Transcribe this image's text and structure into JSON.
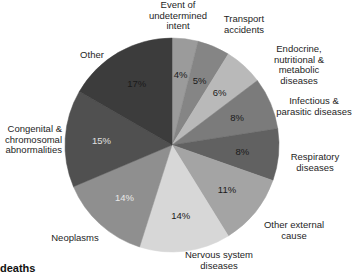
{
  "chart_data": {
    "type": "pie",
    "title": "",
    "start_angle_deg": 0,
    "direction": "clockwise",
    "slices": [
      {
        "label": "Event of undetermined intent",
        "value": 4,
        "pct_label": "4%",
        "color": "#9b9b9b",
        "pct_color": "#1a1a1a"
      },
      {
        "label": "Transport accidents",
        "value": 5,
        "pct_label": "5%",
        "color": "#858585",
        "pct_color": "#1a1a1a"
      },
      {
        "label": "Endocrine, nutritional & metabolic diseases",
        "value": 6,
        "pct_label": "6%",
        "color": "#b9b9b9",
        "pct_color": "#1a1a1a"
      },
      {
        "label": "Infectious & parasitic diseases",
        "value": 8,
        "pct_label": "8%",
        "color": "#7b7b7b",
        "pct_color": "#1a1a1a"
      },
      {
        "label": "Respiratory diseases",
        "value": 8,
        "pct_label": "8%",
        "color": "#616161",
        "pct_color": "#1a1a1a"
      },
      {
        "label": "Other external cause",
        "value": 11,
        "pct_label": "11%",
        "color": "#a4a4a4",
        "pct_color": "#1a1a1a"
      },
      {
        "label": "Nervous system diseases",
        "value": 14,
        "pct_label": "14%",
        "color": "#d7d7d7",
        "pct_color": "#1a1a1a"
      },
      {
        "label": "Neoplasms",
        "value": 14,
        "pct_label": "14%",
        "color": "#8f8f8f",
        "pct_color": "#e8e8e8"
      },
      {
        "label": "Congenital & chromosomal abnormalities",
        "value": 15,
        "pct_label": "15%",
        "color": "#505050",
        "pct_color": "#e0e0e0"
      },
      {
        "label": "Other",
        "value": 17,
        "pct_label": "17%",
        "color": "#3c3c3c",
        "pct_color": "#1a1a1a"
      }
    ]
  },
  "labels": {
    "event": "Event of\nundetermined\nintent",
    "transport": "Transport\naccidents",
    "endocrine": "Endocrine,\nnutritional &\nmetabolic\ndiseases",
    "infectious": "Infectious &\nparasitic diseases",
    "respiratory": "Respiratory\ndiseases",
    "other_external": "Other external\ncause",
    "nervous": "Nervous system\ndiseases",
    "neoplasms": "Neoplasms",
    "congenital": "Congenital &\nchromosomal\nabnormalities",
    "other": "Other"
  },
  "footer": {
    "text": "deaths"
  }
}
